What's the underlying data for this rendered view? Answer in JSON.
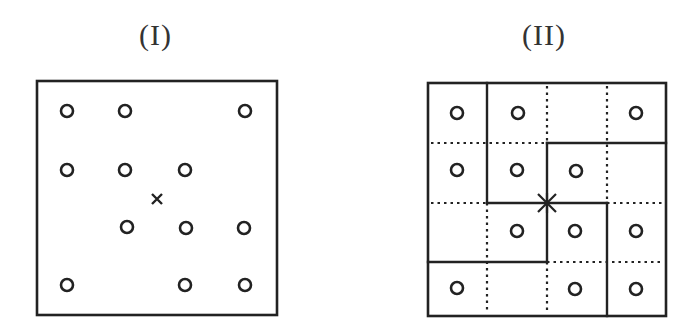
{
  "panels": [
    {
      "id": "I",
      "title": "(I)",
      "box": {
        "x": 37,
        "y": 81,
        "w": 240,
        "h": 234
      },
      "circles": [
        {
          "x": 67,
          "y": 111
        },
        {
          "x": 125,
          "y": 111
        },
        {
          "x": 245,
          "y": 111
        },
        {
          "x": 67,
          "y": 170
        },
        {
          "x": 125,
          "y": 170
        },
        {
          "x": 185,
          "y": 170
        },
        {
          "x": 127,
          "y": 227
        },
        {
          "x": 186,
          "y": 228
        },
        {
          "x": 244,
          "y": 228
        },
        {
          "x": 67,
          "y": 285
        },
        {
          "x": 185,
          "y": 285
        },
        {
          "x": 245,
          "y": 285
        }
      ],
      "marker": {
        "type": "x",
        "x": 157,
        "y": 199
      }
    },
    {
      "id": "II",
      "title": "(II)",
      "box": {
        "x": 428,
        "y": 83,
        "w": 238,
        "h": 233
      },
      "circles": [
        {
          "x": 457,
          "y": 113
        },
        {
          "x": 518,
          "y": 113
        },
        {
          "x": 636,
          "y": 113
        },
        {
          "x": 457,
          "y": 170
        },
        {
          "x": 517,
          "y": 170
        },
        {
          "x": 576,
          "y": 171
        },
        {
          "x": 517,
          "y": 231
        },
        {
          "x": 575,
          "y": 231
        },
        {
          "x": 636,
          "y": 231
        },
        {
          "x": 457,
          "y": 288
        },
        {
          "x": 575,
          "y": 289
        },
        {
          "x": 636,
          "y": 289
        }
      ],
      "solid_lines": [
        {
          "x1": 487,
          "y1": 83,
          "x2": 487,
          "y2": 203
        },
        {
          "x1": 547,
          "y1": 143,
          "x2": 666,
          "y2": 143
        },
        {
          "x1": 547,
          "y1": 143,
          "x2": 547,
          "y2": 262
        },
        {
          "x1": 487,
          "y1": 203,
          "x2": 607,
          "y2": 203
        },
        {
          "x1": 607,
          "y1": 203,
          "x2": 607,
          "y2": 316
        },
        {
          "x1": 428,
          "y1": 262,
          "x2": 547,
          "y2": 262
        }
      ],
      "dotted_lines": [
        {
          "x1": 431,
          "y1": 143,
          "x2": 547,
          "y2": 143
        },
        {
          "x1": 547,
          "y1": 86,
          "x2": 547,
          "y2": 143
        },
        {
          "x1": 607,
          "y1": 86,
          "x2": 607,
          "y2": 203
        },
        {
          "x1": 431,
          "y1": 203,
          "x2": 487,
          "y2": 203
        },
        {
          "x1": 607,
          "y1": 203,
          "x2": 663,
          "y2": 203
        },
        {
          "x1": 487,
          "y1": 203,
          "x2": 487,
          "y2": 313
        },
        {
          "x1": 547,
          "y1": 262,
          "x2": 663,
          "y2": 262
        },
        {
          "x1": 547,
          "y1": 262,
          "x2": 547,
          "y2": 313
        }
      ],
      "marker": {
        "type": "star",
        "x": 547,
        "y": 203
      }
    }
  ],
  "style": {
    "stroke": "#222222",
    "circle_radius": 6,
    "circle_stroke_width": 2.6
  }
}
